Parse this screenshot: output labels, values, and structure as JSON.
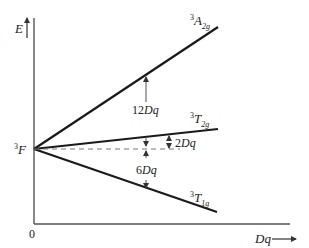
{
  "diagram": {
    "type": "energy-level splitting diagram",
    "y_axis_label": "E",
    "x_axis_label": "Dq",
    "origin_label": "0",
    "free_ion_term": {
      "sup": "3",
      "main": "F"
    },
    "levels": [
      {
        "sup": "3",
        "main": "A",
        "sub": "2g",
        "slope_dq": 12
      },
      {
        "sup": "3",
        "main": "T",
        "sub": "2g",
        "slope_dq": 2
      },
      {
        "sup": "3",
        "main": "T",
        "sub": "1g",
        "slope_dq": -6
      }
    ],
    "annotations": [
      {
        "num": "12",
        "unit": "Dq"
      },
      {
        "num": "2",
        "unit": "Dq"
      },
      {
        "num": "6",
        "unit": "Dq"
      }
    ]
  },
  "colors": {
    "axis": "#555555",
    "line": "#1a1a1a",
    "dashed": "#777777",
    "text": "#222222"
  }
}
